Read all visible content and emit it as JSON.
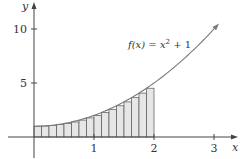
{
  "chart_data": {
    "type": "area",
    "title": "",
    "function_label": {
      "prefix": "f(x) = x",
      "exp": "2",
      "suffix": " + 1"
    },
    "xlabel": "x",
    "ylabel": "y",
    "xlim": [
      -0.43,
      3.37
    ],
    "ylim": [
      -2.0,
      12.7
    ],
    "x_ticks": [
      {
        "value": 1,
        "label": "1"
      },
      {
        "value": 2,
        "label": "2"
      },
      {
        "value": 3,
        "label": "3"
      }
    ],
    "y_ticks": [
      {
        "value": 5,
        "label": "5"
      },
      {
        "value": 10,
        "label": "10"
      }
    ],
    "grid": false,
    "curve": {
      "expression": "x^2 + 1",
      "x_start": 0,
      "x_end": 3.05,
      "arrow_at_end": true,
      "color": "#7a7a7a"
    },
    "rectangles": {
      "method": "left-endpoint",
      "n": 16,
      "dx": 0.125,
      "x": [
        0,
        0.125,
        0.25,
        0.375,
        0.5,
        0.625,
        0.75,
        0.875,
        1,
        1.125,
        1.25,
        1.375,
        1.5,
        1.625,
        1.75,
        1.875
      ],
      "heights": [
        1,
        1.016,
        1.063,
        1.141,
        1.25,
        1.391,
        1.563,
        1.766,
        2,
        2.266,
        2.563,
        2.891,
        3.25,
        3.641,
        4.063,
        4.516
      ],
      "fill": "#e6e6e6",
      "stroke": "#555555"
    },
    "axis_color": "#444444"
  }
}
